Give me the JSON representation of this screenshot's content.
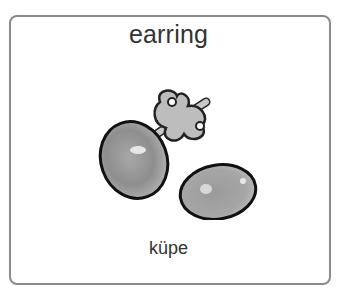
{
  "card": {
    "title": "earring",
    "subtitle": "küpe",
    "image": {
      "icon": "earring-icon",
      "description": "pair of stud earrings with backing"
    }
  },
  "colors": {
    "border": "#8a8a8a",
    "text": "#333333",
    "gem": "#9a9a9a"
  }
}
